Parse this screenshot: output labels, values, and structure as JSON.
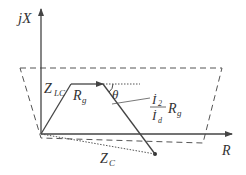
{
  "diagram": {
    "type": "impedance-plane",
    "axes": {
      "vertical_label": "jX",
      "horizontal_label": "R"
    },
    "labels": {
      "z_lc_main": "Z",
      "z_lc_sub": "LC",
      "r_g_main": "R",
      "r_g_sub": "g",
      "theta": "θ",
      "frac_num_main": "İ",
      "frac_num_sub": "2",
      "frac_den_main": "İ",
      "frac_den_sub": "d",
      "frac_r_main": "R",
      "frac_r_sub": "g",
      "z_c_main": "Z",
      "z_c_sub": "C"
    },
    "colors": {
      "line": "#444444",
      "text": "#333333",
      "background": "#ffffff"
    }
  }
}
